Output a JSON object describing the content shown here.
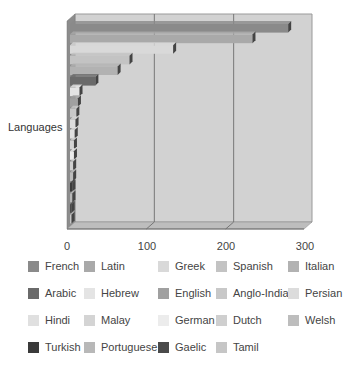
{
  "chart_data": {
    "type": "bar",
    "orientation": "horizontal",
    "style": "3d",
    "title": "",
    "xlabel": "",
    "ylabel": "Languages",
    "xlim": [
      0,
      300
    ],
    "xticks": [
      0,
      100,
      200,
      300
    ],
    "grid": true,
    "legend_position": "bottom",
    "series": [
      {
        "name": "French",
        "value": 275,
        "color": "#8a8a8a"
      },
      {
        "name": "Latin",
        "value": 230,
        "color": "#a9a9a9"
      },
      {
        "name": "Greek",
        "value": 130,
        "color": "#d9d9d9"
      },
      {
        "name": "Spanish",
        "value": 75,
        "color": "#c3c3c3"
      },
      {
        "name": "Italian",
        "value": 60,
        "color": "#b2b2b2"
      },
      {
        "name": "Arabic",
        "value": 32,
        "color": "#6a6a6a"
      },
      {
        "name": "Hebrew",
        "value": 12,
        "color": "#e4e4e4"
      },
      {
        "name": "English",
        "value": 10,
        "color": "#a0a0a0"
      },
      {
        "name": "Anglo-Indian",
        "value": 8,
        "color": "#c8c8c8"
      },
      {
        "name": "Persian",
        "value": 7,
        "color": "#dcdcdc"
      },
      {
        "name": "Hindi",
        "value": 6,
        "color": "#e0e0e0"
      },
      {
        "name": "Malay",
        "value": 5,
        "color": "#d4d4d4"
      },
      {
        "name": "German",
        "value": 5,
        "color": "#ececec"
      },
      {
        "name": "Dutch",
        "value": 4,
        "color": "#cfcfcf"
      },
      {
        "name": "Welsh",
        "value": 4,
        "color": "#bdbdbd"
      },
      {
        "name": "Turkish",
        "value": 3,
        "color": "#3a3a3a"
      },
      {
        "name": "Portuguese",
        "value": 3,
        "color": "#b8b8b8"
      },
      {
        "name": "Gaelic",
        "value": 2,
        "color": "#4a4a4a"
      },
      {
        "name": "Tamil",
        "value": 2,
        "color": "#c6c6c6"
      }
    ]
  },
  "axis": {
    "y_label": "Languages",
    "x_ticks": [
      "0",
      "100",
      "200",
      "300"
    ]
  },
  "legend": {
    "items": [
      {
        "label": "French",
        "color": "#8a8a8a"
      },
      {
        "label": "Latin",
        "color": "#a9a9a9"
      },
      {
        "label": "Greek",
        "color": "#d9d9d9"
      },
      {
        "label": "Spanish",
        "color": "#c3c3c3"
      },
      {
        "label": "Italian",
        "color": "#b2b2b2"
      },
      {
        "label": "Arabic",
        "color": "#6a6a6a"
      },
      {
        "label": "Hebrew",
        "color": "#e4e4e4"
      },
      {
        "label": "English",
        "color": "#a0a0a0"
      },
      {
        "label": "Anglo-Indian",
        "color": "#c8c8c8"
      },
      {
        "label": "Persian",
        "color": "#dcdcdc"
      },
      {
        "label": "Hindi",
        "color": "#e0e0e0"
      },
      {
        "label": "Malay",
        "color": "#d4d4d4"
      },
      {
        "label": "German",
        "color": "#ececec"
      },
      {
        "label": "Dutch",
        "color": "#cfcfcf"
      },
      {
        "label": "Welsh",
        "color": "#bdbdbd"
      },
      {
        "label": "Turkish",
        "color": "#3a3a3a"
      },
      {
        "label": "Portuguese",
        "color": "#b8b8b8"
      },
      {
        "label": "Gaelic",
        "color": "#4a4a4a"
      },
      {
        "label": "Tamil",
        "color": "#c6c6c6"
      }
    ]
  }
}
